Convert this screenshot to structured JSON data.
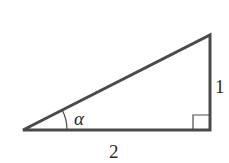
{
  "diagram": {
    "type": "right-triangle",
    "vertices": {
      "left": [
        23,
        130
      ],
      "bottom_right": [
        210,
        130
      ],
      "top_right": [
        210,
        35
      ]
    },
    "labels": {
      "angle": "α",
      "vertical_side": "1",
      "horizontal_side": "2"
    },
    "right_angle_marker": true,
    "stroke_color": "#4a4a4a"
  }
}
